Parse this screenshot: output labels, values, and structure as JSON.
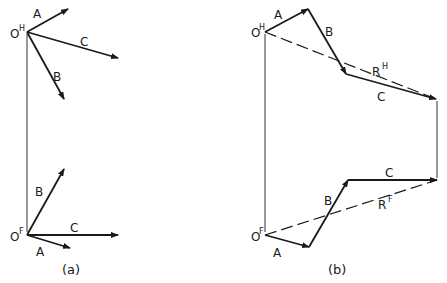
{
  "figure": {
    "panel_a": {
      "caption": "(a)",
      "top_origin": {
        "base": "O",
        "sup": "H"
      },
      "bottom_origin": {
        "base": "O",
        "sup": "F"
      },
      "top_vectors": [
        {
          "label": "A",
          "from": [
            27,
            32
          ],
          "to": [
            68,
            9
          ]
        },
        {
          "label": "B",
          "from": [
            27,
            32
          ],
          "to": [
            64,
            99
          ]
        },
        {
          "label": "C",
          "from": [
            27,
            32
          ],
          "to": [
            118,
            58
          ]
        }
      ],
      "bottom_vectors": [
        {
          "label": "A",
          "from": [
            27,
            235
          ],
          "to": [
            70,
            248
          ]
        },
        {
          "label": "B",
          "from": [
            27,
            235
          ],
          "to": [
            64,
            169
          ]
        },
        {
          "label": "C",
          "from": [
            27,
            235
          ],
          "to": [
            118,
            235
          ]
        }
      ]
    },
    "panel_b": {
      "caption": "(b)",
      "top_origin": {
        "base": "O",
        "sup": "H"
      },
      "bottom_origin": {
        "base": "O",
        "sup": "F"
      },
      "top_chain": [
        {
          "label": "A",
          "from": [
            265,
            32
          ],
          "to": [
            308,
            9
          ]
        },
        {
          "label": "B",
          "from": [
            308,
            9
          ],
          "to": [
            346,
            74
          ]
        },
        {
          "label": "C",
          "from": [
            346,
            74
          ],
          "to": [
            436,
            99
          ]
        }
      ],
      "top_resultant": {
        "base": "R",
        "sup": "H",
        "from": [
          265,
          32
        ],
        "to": [
          436,
          99
        ]
      },
      "bottom_chain": [
        {
          "label": "A",
          "from": [
            265,
            235
          ],
          "to": [
            309,
            247
          ]
        },
        {
          "label": "B",
          "from": [
            309,
            247
          ],
          "to": [
            348,
            180
          ]
        },
        {
          "label": "C",
          "from": [
            348,
            180
          ],
          "to": [
            437,
            180
          ]
        }
      ],
      "bottom_resultant": {
        "base": "R",
        "sup": "F",
        "from": [
          265,
          235
        ],
        "to": [
          437,
          180
        ]
      }
    }
  }
}
